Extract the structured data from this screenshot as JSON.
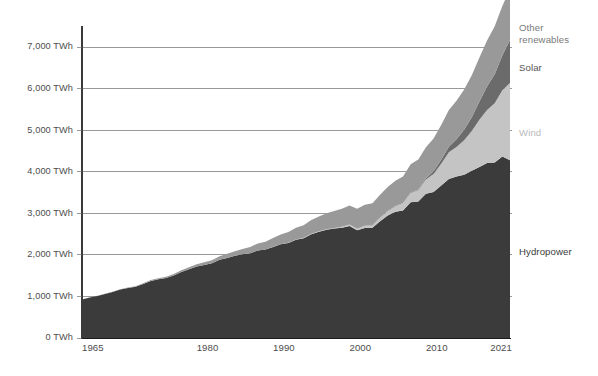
{
  "chart_data": {
    "type": "area",
    "stacked": true,
    "title": "",
    "subtitle": "",
    "xlabel": "",
    "ylabel": "",
    "unit": "TWh",
    "xlim": [
      1965,
      2021
    ],
    "ylim": [
      0,
      7500
    ],
    "grid": true,
    "legend_position": "inline-right",
    "y_ticks": [
      0,
      1000,
      2000,
      3000,
      4000,
      5000,
      6000,
      7000
    ],
    "y_tick_labels": [
      "0 TWh",
      "1,000 TWh",
      "2,000 TWh",
      "3,000 TWh",
      "4,000 TWh",
      "5,000 TWh",
      "6,000 TWh",
      "7,000 TWh"
    ],
    "x_ticks": [
      1965,
      1980,
      1990,
      2000,
      2010,
      2021
    ],
    "x_tick_labels": [
      "1965",
      "1980",
      "1990",
      "2000",
      "2010",
      "2021"
    ],
    "x": [
      1965,
      1966,
      1967,
      1968,
      1969,
      1970,
      1971,
      1972,
      1973,
      1974,
      1975,
      1976,
      1977,
      1978,
      1979,
      1980,
      1981,
      1982,
      1983,
      1984,
      1985,
      1986,
      1987,
      1988,
      1989,
      1990,
      1991,
      1992,
      1993,
      1994,
      1995,
      1996,
      1997,
      1998,
      1999,
      2000,
      2001,
      2002,
      2003,
      2004,
      2005,
      2006,
      2007,
      2008,
      2009,
      2010,
      2011,
      2012,
      2013,
      2014,
      2015,
      2016,
      2017,
      2018,
      2019,
      2020,
      2021
    ],
    "series": [
      {
        "name": "Hydropower",
        "color": "#3b3b3b",
        "label_color": "#3b3b3b",
        "values": [
          928,
          972,
          1012,
          1061,
          1105,
          1166,
          1204,
          1231,
          1301,
          1374,
          1415,
          1443,
          1504,
          1589,
          1655,
          1717,
          1759,
          1796,
          1880,
          1927,
          1977,
          2012,
          2041,
          2103,
          2127,
          2191,
          2253,
          2286,
          2364,
          2402,
          2498,
          2557,
          2605,
          2633,
          2654,
          2697,
          2592,
          2648,
          2652,
          2809,
          2945,
          3039,
          3070,
          3268,
          3282,
          3468,
          3511,
          3668,
          3827,
          3883,
          3926,
          4022,
          4112,
          4210,
          4222,
          4367,
          4274
        ]
      },
      {
        "name": "Wind",
        "color": "#c4c4c4",
        "label_color": "#c4c4c4",
        "values": [
          0,
          0,
          0,
          0,
          0,
          0,
          0,
          0,
          0,
          0,
          0,
          0,
          0,
          0,
          0,
          0,
          0,
          0,
          0,
          0,
          0,
          0,
          0,
          0,
          0,
          4,
          5,
          6,
          7,
          8,
          9,
          10,
          12,
          15,
          21,
          31,
          38,
          52,
          63,
          85,
          104,
          133,
          170,
          220,
          276,
          342,
          435,
          525,
          639,
          711,
          832,
          959,
          1136,
          1273,
          1427,
          1591,
          1862
        ]
      },
      {
        "name": "Solar",
        "color": "#6b6b6b",
        "label_color": "#6b6b6b",
        "values": [
          0,
          0,
          0,
          0,
          0,
          0,
          0,
          0,
          0,
          0,
          0,
          0,
          0,
          0,
          0,
          0,
          0,
          0,
          0,
          0,
          0,
          0,
          0,
          0,
          0,
          0,
          0,
          0,
          0,
          0,
          0,
          0,
          0,
          0,
          0,
          1,
          1,
          1,
          1,
          2,
          4,
          5,
          7,
          12,
          20,
          32,
          63,
          96,
          134,
          190,
          254,
          328,
          444,
          570,
          697,
          844,
          1033
        ]
      },
      {
        "name": "Other renewables",
        "color": "#999999",
        "label_color": "#999999",
        "values": [
          3,
          4,
          5,
          6,
          7,
          9,
          11,
          13,
          16,
          20,
          24,
          29,
          34,
          40,
          47,
          55,
          63,
          73,
          84,
          97,
          112,
          129,
          148,
          170,
          190,
          211,
          233,
          256,
          280,
          305,
          330,
          355,
          381,
          407,
          433,
          459,
          480,
          503,
          527,
          552,
          578,
          605,
          640,
          678,
          713,
          748,
          790,
          835,
          882,
          925,
          968,
          1012,
          1057,
          1104,
          1152,
          1185,
          1228
        ]
      }
    ],
    "series_labels": [
      {
        "name": "Other renewables",
        "lines": [
          "Other",
          "renewables"
        ],
        "color": "#7a7a7a"
      },
      {
        "name": "Solar",
        "lines": [
          "Solar"
        ],
        "color": "#555555"
      },
      {
        "name": "Wind",
        "lines": [
          "Wind"
        ],
        "color": "#b9b9b9"
      },
      {
        "name": "Hydropower",
        "lines": [
          "Hydropower"
        ],
        "color": "#3b3b3b"
      }
    ]
  },
  "layout": {
    "plot_left": 82,
    "plot_right": 510,
    "plot_top": 16,
    "plot_bottom": 338,
    "y_zero_px": 338,
    "y_per_1000_px": 41.57
  }
}
